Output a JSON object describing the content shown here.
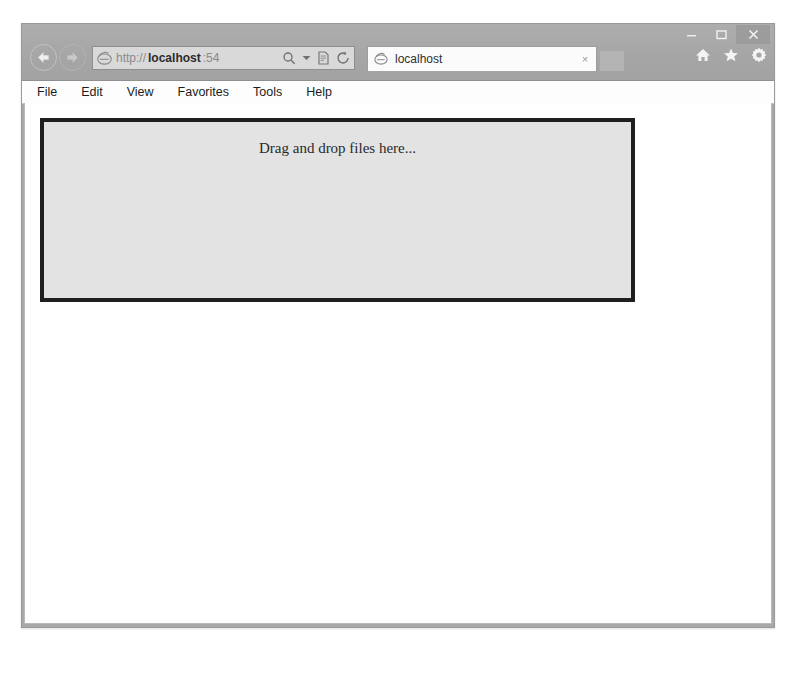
{
  "window": {
    "controls": {
      "minimize_label": "Minimize",
      "maximize_label": "Maximize",
      "close_label": "Close"
    },
    "toolbar_icons": [
      {
        "name": "home-icon",
        "label": "Home"
      },
      {
        "name": "favorites-star-icon",
        "label": "Favorites"
      },
      {
        "name": "settings-gear-icon",
        "label": "Tools"
      }
    ]
  },
  "navigation": {
    "back_label": "Back",
    "forward_label": "Forward"
  },
  "address_bar": {
    "scheme": "http://",
    "host": "localhost",
    "rest": ":54",
    "full_url": "http://localhost:54",
    "placeholder": "Search or enter web address",
    "icons": {
      "site": "ie-logo-icon",
      "search": "search-icon",
      "dropdown": "chevron-down-icon",
      "compatibility": "compatibility-view-icon",
      "refresh": "refresh-icon"
    }
  },
  "tabs": [
    {
      "title": "localhost",
      "close_label": "×",
      "active": true
    }
  ],
  "new_tab_label": "",
  "menu": {
    "items": [
      {
        "label": "File"
      },
      {
        "label": "Edit"
      },
      {
        "label": "View"
      },
      {
        "label": "Favorites"
      },
      {
        "label": "Tools"
      },
      {
        "label": "Help"
      }
    ]
  },
  "page": {
    "drop_zone": {
      "text": "Drag and drop files here...",
      "fill_color": "#e3e3e3",
      "border_color": "#1f1f1f"
    }
  }
}
